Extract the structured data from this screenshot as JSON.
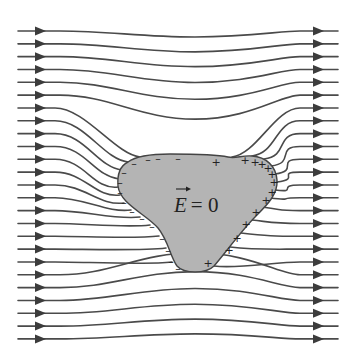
{
  "diagram": {
    "label": {
      "symbol": "E",
      "vector": true,
      "equals": "= 0",
      "x": 174,
      "y": 212
    },
    "colors": {
      "line": "#4a4a4a",
      "arrow": "#3c3c3c",
      "conductor_fill": "#b4b4b4",
      "conductor_stroke": "#444444",
      "text": "#222222"
    },
    "field": {
      "count": 25,
      "y_start": 31,
      "y_step": 12.83,
      "x_left": 18,
      "x_right": 338,
      "arrow_left_x": 40,
      "arrow_right_x": 318,
      "direction": "left-to-right"
    },
    "conductor": {
      "path": "M 128 162 C 136 156, 150 154, 170 154 C 195 154, 215 154, 228 157 C 236 159, 242 155, 252 156 C 266 157, 276 166, 277 180 C 278 194, 268 204, 256 216 C 242 230, 226 252, 214 266 C 206 274, 184 274, 177 266 C 170 256, 168 240, 158 228 C 146 214, 120 204, 118 186 C 117 174, 120 166, 128 162 Z",
      "negative_charges": [
        [
          134,
          163
        ],
        [
          148,
          159
        ],
        [
          158,
          158
        ],
        [
          178,
          158
        ],
        [
          124,
          172
        ],
        [
          120,
          182
        ],
        [
          120,
          192
        ],
        [
          124,
          202
        ],
        [
          132,
          211
        ],
        [
          142,
          218
        ],
        [
          152,
          226
        ],
        [
          162,
          238
        ],
        [
          168,
          250
        ],
        [
          171,
          261
        ],
        [
          178,
          268
        ]
      ],
      "positive_charges": [
        [
          216,
          162
        ],
        [
          245,
          160
        ],
        [
          255,
          162
        ],
        [
          262,
          164
        ],
        [
          268,
          168
        ],
        [
          272,
          174
        ],
        [
          274,
          182
        ],
        [
          272,
          192
        ],
        [
          266,
          200
        ],
        [
          256,
          212
        ],
        [
          246,
          224
        ],
        [
          237,
          238
        ],
        [
          229,
          250
        ],
        [
          208,
          263
        ]
      ]
    },
    "charge_symbols": {
      "negative": "–",
      "positive": "+"
    }
  }
}
